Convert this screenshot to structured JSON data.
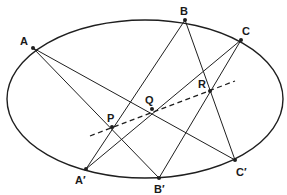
{
  "diagram": {
    "type": "pascal-theorem-ellipse",
    "colors": {
      "stroke": "#1f1f1f",
      "background": "#ffffff"
    },
    "ellipse": {
      "cx": 145,
      "cy": 99,
      "rx": 138,
      "ry": 79
    },
    "points": {
      "A": {
        "label": "A",
        "x": 33,
        "y": 48,
        "lx": 20,
        "ly": 45
      },
      "B": {
        "label": "B",
        "x": 185,
        "y": 20,
        "lx": 180,
        "ly": 15
      },
      "C": {
        "label": "C",
        "x": 241,
        "y": 40,
        "lx": 242,
        "ly": 35
      },
      "A2": {
        "label": "A′",
        "x": 86,
        "y": 169,
        "lx": 75,
        "ly": 184
      },
      "B2": {
        "label": "B′",
        "x": 159,
        "y": 178,
        "lx": 154,
        "ly": 193
      },
      "C2": {
        "label": "C′",
        "x": 235,
        "y": 160,
        "lx": 236,
        "ly": 176
      },
      "P": {
        "label": "P",
        "x": 112,
        "y": 127,
        "lx": 107,
        "ly": 122
      },
      "Q": {
        "label": "Q",
        "x": 152,
        "y": 109,
        "lx": 145,
        "ly": 104
      },
      "R": {
        "label": "R",
        "x": 210,
        "y": 91,
        "lx": 198,
        "ly": 88
      }
    },
    "lines": [
      {
        "from": "A",
        "to": "B2"
      },
      {
        "from": "A",
        "to": "C2"
      },
      {
        "from": "B",
        "to": "A2"
      },
      {
        "from": "B",
        "to": "C2"
      },
      {
        "from": "C",
        "to": "A2"
      },
      {
        "from": "C",
        "to": "B2"
      }
    ],
    "pascal_line": {
      "x1": 90,
      "y1": 136,
      "x2": 235,
      "y2": 81,
      "style": "dashed"
    }
  }
}
